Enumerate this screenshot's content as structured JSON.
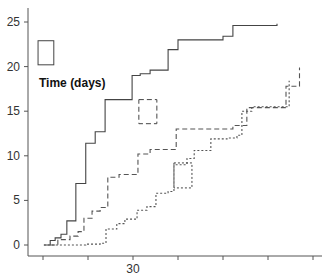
{
  "chart_data": {
    "type": "line",
    "step": true,
    "title": "",
    "legend_title": "Time (days)",
    "xlabel": "",
    "ylabel": "",
    "x_ticks": [
      10,
      20,
      30,
      40,
      50,
      60,
      70
    ],
    "x_tick_labels": [
      "",
      "",
      "30",
      "",
      "",
      "",
      ""
    ],
    "y_ticks": [
      0,
      5,
      10,
      15,
      20,
      25
    ],
    "y_tick_labels": [
      "0",
      "5",
      "10",
      "15",
      "20",
      "25"
    ],
    "xlim": [
      8,
      73
    ],
    "ylim": [
      -1.5,
      26.5
    ],
    "grid": false,
    "legend_position": "inline boxes",
    "series": [
      {
        "name": "solid",
        "style": "solid",
        "points": [
          [
            10.2,
            0
          ],
          [
            11.6,
            0.5
          ],
          [
            12.7,
            0.8
          ],
          [
            14,
            1.2
          ],
          [
            15.3,
            2.7
          ],
          [
            17.3,
            6.9
          ],
          [
            19.5,
            11.4
          ],
          [
            21.6,
            12.7
          ],
          [
            23.8,
            16.3
          ],
          [
            25.8,
            16.3
          ],
          [
            29.8,
            19.0
          ],
          [
            31.6,
            19.2
          ],
          [
            33.8,
            19.6
          ],
          [
            37.8,
            21.9
          ],
          [
            40,
            23.0
          ],
          [
            50,
            23.4
          ],
          [
            52.2,
            24.6
          ],
          [
            62,
            24.8
          ]
        ],
        "legend_box": [
          8.9,
          20.2,
          12.4,
          22.9
        ]
      },
      {
        "name": "long-dash",
        "style": "dashed",
        "points": [
          [
            11.6,
            0
          ],
          [
            13.3,
            0.6
          ],
          [
            16,
            1.0
          ],
          [
            17.8,
            1.5
          ],
          [
            19.1,
            3.0
          ],
          [
            20.9,
            3.8
          ],
          [
            22.7,
            4.2
          ],
          [
            24.4,
            7.6
          ],
          [
            26.9,
            7.9
          ],
          [
            31.1,
            10.2
          ],
          [
            33.8,
            10.7
          ],
          [
            39.6,
            13.0
          ],
          [
            52.2,
            13.4
          ],
          [
            55.3,
            15.4
          ],
          [
            64,
            17.8
          ],
          [
            67,
            17.8
          ],
          [
            67,
            19.9
          ]
        ],
        "legend_box": [
          31.3,
          13.6,
          35.3,
          16.3
        ]
      },
      {
        "name": "short-dot",
        "style": "dotted",
        "points": [
          [
            10.2,
            0
          ],
          [
            18.2,
            0
          ],
          [
            19.5,
            0.1
          ],
          [
            22.7,
            0.2
          ],
          [
            24,
            1.8
          ],
          [
            26.4,
            2.4
          ],
          [
            28.2,
            2.9
          ],
          [
            30.9,
            3.9
          ],
          [
            33.1,
            4.3
          ],
          [
            35.1,
            5.8
          ],
          [
            37.8,
            6.0
          ],
          [
            39.1,
            9.0
          ],
          [
            42,
            9.7
          ],
          [
            43.6,
            10.6
          ],
          [
            47.3,
            11.9
          ],
          [
            50.9,
            12.0
          ],
          [
            53.1,
            12.3
          ],
          [
            54.2,
            15.0
          ],
          [
            56.4,
            15.5
          ],
          [
            64.7,
            16.1
          ],
          [
            64.7,
            18.4
          ]
        ],
        "legend_box": [
          39.1,
          6.4,
          43.1,
          9.2
        ]
      }
    ]
  }
}
